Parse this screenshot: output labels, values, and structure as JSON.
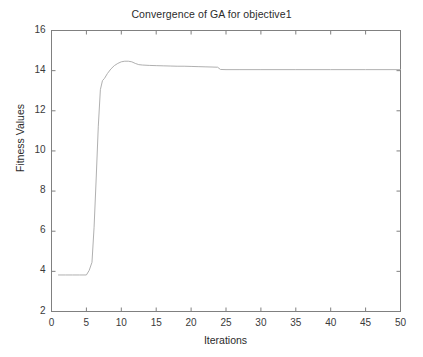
{
  "chart_data": {
    "type": "line",
    "title": "Convergence of GA for objective1",
    "xlabel": "Iterations",
    "ylabel": "Fitness Values",
    "xlim": [
      0,
      50
    ],
    "ylim": [
      2,
      16
    ],
    "xticks": [
      0,
      5,
      10,
      15,
      20,
      25,
      30,
      35,
      40,
      45,
      50
    ],
    "yticks": [
      2,
      4,
      6,
      8,
      10,
      12,
      14,
      16
    ],
    "xtick_labels": [
      "0",
      "5",
      "10",
      "15",
      "20",
      "25",
      "30",
      "35",
      "40",
      "45",
      "50"
    ],
    "ytick_labels": [
      "2",
      "4",
      "6",
      "8",
      "10",
      "12",
      "14",
      "16"
    ],
    "grid": false,
    "legend": null,
    "line_color": "#b0b0b0",
    "line_width": 1,
    "background_color": "#ffffff",
    "axes_color": "#808080",
    "text_color": "#2b2b2b",
    "series": [
      {
        "name": "Best fitness",
        "x": [
          1,
          2,
          3,
          4,
          5,
          5.4,
          5.8,
          6.1,
          6.4,
          6.7,
          7.0,
          7.3,
          7.6,
          8.0,
          8.5,
          9.0,
          9.5,
          10.0,
          10.5,
          11.0,
          11.5,
          12.0,
          12.5,
          13.0,
          14.0,
          15.0,
          16.0,
          17.0,
          18.0,
          19.0,
          20.0,
          21.0,
          22.0,
          23.0,
          23.8,
          24.2,
          25.0,
          27.0,
          30.0,
          35.0,
          40.0,
          45.0,
          50.0
        ],
        "y": [
          3.82,
          3.82,
          3.82,
          3.82,
          3.82,
          4.05,
          4.45,
          6.2,
          8.6,
          11.2,
          13.05,
          13.5,
          13.62,
          13.85,
          14.08,
          14.25,
          14.36,
          14.44,
          14.47,
          14.47,
          14.44,
          14.36,
          14.3,
          14.28,
          14.26,
          14.25,
          14.24,
          14.23,
          14.22,
          14.22,
          14.21,
          14.2,
          14.19,
          14.18,
          14.17,
          14.06,
          14.05,
          14.05,
          14.05,
          14.05,
          14.05,
          14.05,
          14.05
        ]
      }
    ],
    "annotations": []
  }
}
